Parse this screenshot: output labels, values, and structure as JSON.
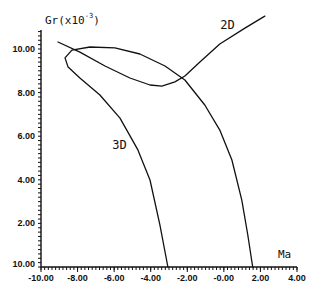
{
  "chart_data": {
    "type": "line",
    "title": "",
    "xlabel": "Ma",
    "ylabel": "Gr(x10^-3)",
    "ylabel_parts": {
      "base": "Gr(x10",
      "exp": "-3",
      "close": ")"
    },
    "xlim": [
      -10,
      4
    ],
    "ylim": [
      0,
      10
    ],
    "x_ticks": [
      -10,
      -8,
      -6,
      -4,
      -2,
      0,
      2,
      4
    ],
    "x_tick_labels": [
      "-10.00",
      "-8.00",
      "-6.00",
      "-4.00",
      "-2.00",
      "-0.00",
      "2.00",
      "4.00"
    ],
    "y_ticks": [
      0,
      2,
      4,
      6,
      8,
      10
    ],
    "y_tick_labels": [
      "10.00",
      "2.00",
      "4.00",
      "6.00",
      "8.00",
      "10.00"
    ],
    "grid": false,
    "legend": "inline-labels",
    "series": [
      {
        "name": "3D",
        "label_at": [
          -6.1,
          5.4
        ],
        "points": [
          [
            -3.06,
            0.0
          ],
          [
            -3.5,
            1.93
          ],
          [
            -4.04,
            3.99
          ],
          [
            -4.7,
            5.37
          ],
          [
            -5.68,
            6.83
          ],
          [
            -6.78,
            7.89
          ],
          [
            -7.87,
            8.67
          ],
          [
            -8.52,
            9.17
          ],
          [
            -8.69,
            9.59
          ],
          [
            -8.31,
            9.95
          ],
          [
            -7.32,
            10.09
          ],
          [
            -5.96,
            10.05
          ],
          [
            -4.59,
            9.77
          ],
          [
            -3.22,
            9.22
          ],
          [
            -2.13,
            8.58
          ],
          [
            -1.04,
            7.43
          ],
          [
            -0.22,
            6.28
          ],
          [
            0.44,
            4.91
          ],
          [
            0.98,
            3.07
          ],
          [
            1.31,
            1.47
          ],
          [
            1.58,
            0.0
          ]
        ]
      },
      {
        "name": "2D",
        "label_at": [
          -0.2,
          10.9
        ],
        "points": [
          [
            -9.07,
            10.32
          ],
          [
            -7.87,
            9.86
          ],
          [
            -6.5,
            9.22
          ],
          [
            -5.14,
            8.67
          ],
          [
            -4.04,
            8.35
          ],
          [
            -3.39,
            8.3
          ],
          [
            -2.68,
            8.49
          ],
          [
            -2.13,
            8.76
          ],
          [
            -1.31,
            9.4
          ],
          [
            -0.22,
            10.23
          ],
          [
            1.15,
            10.96
          ],
          [
            2.24,
            11.51
          ]
        ]
      }
    ]
  }
}
